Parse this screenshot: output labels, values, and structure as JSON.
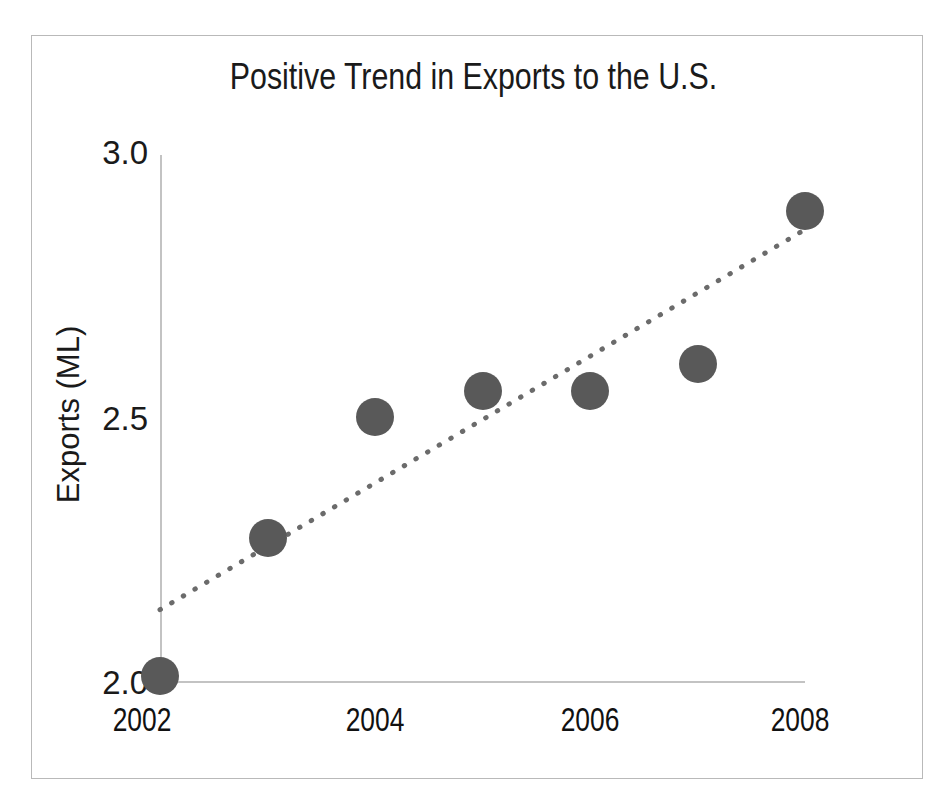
{
  "chart_data": {
    "type": "scatter",
    "title": "Positive Trend in Exports to the U.S.",
    "xlabel": "",
    "ylabel": "Exports (ML)",
    "x": [
      2002,
      2003,
      2004,
      2005,
      2006,
      2007,
      2008
    ],
    "values": [
      2.01,
      2.27,
      2.5,
      2.55,
      2.55,
      2.6,
      2.89
    ],
    "series": [
      {
        "name": "Exports (ML)",
        "x": [
          2002,
          2003,
          2004,
          2005,
          2006,
          2007,
          2008
        ],
        "values": [
          2.01,
          2.27,
          2.5,
          2.55,
          2.55,
          2.6,
          2.89
        ]
      }
    ],
    "xlim": [
      2002,
      2008
    ],
    "ylim": [
      2.0,
      3.0
    ],
    "x_tick_labels": [
      "2002",
      "2004",
      "2006",
      "2008"
    ],
    "x_tick_values": [
      2002,
      2004,
      2006,
      2008
    ],
    "y_tick_labels": [
      "3.0",
      "2.5",
      "2.0"
    ],
    "y_tick_values": [
      3.0,
      2.5,
      2.0
    ],
    "grid": false,
    "legend": "none",
    "marker_color": "#595959",
    "marker_shape": "circle",
    "axis_color": "#c3c3c3",
    "text_color": "#1a1a1a",
    "trendline": {
      "style": "dotted",
      "color": "#6b6b6b",
      "x_start": 2002,
      "y_start": 2.135,
      "x_end": 2008,
      "y_end": 2.855
    },
    "annotations": []
  },
  "figure": {
    "background_color": "#ffffff",
    "frame_color": "#b9b9b9"
  }
}
